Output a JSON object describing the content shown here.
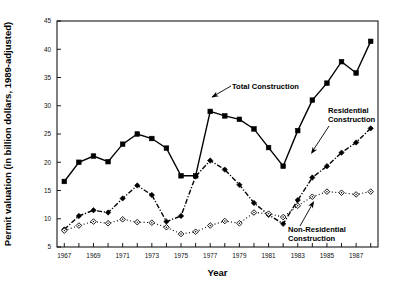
{
  "chart_data": {
    "type": "line",
    "title": "",
    "xlabel": "Year",
    "ylabel": "Permit valuation (in billion dollars, 1989-adjusted)",
    "xlim": [
      1966.5,
      1988.5
    ],
    "ylim": [
      5,
      45
    ],
    "yticks": [
      5,
      10,
      15,
      20,
      25,
      30,
      35,
      40,
      45
    ],
    "xticks": [
      1967,
      1969,
      1971,
      1973,
      1975,
      1977,
      1979,
      1981,
      1983,
      1985,
      1987
    ],
    "xticks_minor": [
      1968,
      1970,
      1972,
      1974,
      1976,
      1978,
      1980,
      1982,
      1984,
      1986,
      1988
    ],
    "grid": false,
    "legend_position": "inline-annotations",
    "x": [
      1967,
      1968,
      1969,
      1970,
      1971,
      1972,
      1973,
      1974,
      1975,
      1976,
      1977,
      1978,
      1979,
      1980,
      1981,
      1982,
      1983,
      1984,
      1985,
      1986,
      1987,
      1988
    ],
    "series": [
      {
        "name": "Total Construction",
        "marker": "filled-square",
        "linestyle": "solid",
        "color": "#000000",
        "values": [
          16.6,
          20.0,
          21.1,
          20.1,
          23.2,
          25.0,
          24.2,
          22.5,
          17.6,
          17.6,
          29.0,
          28.2,
          27.6,
          25.9,
          22.6,
          19.3,
          25.6,
          31.0,
          34.0,
          37.8,
          35.8,
          41.4
        ]
      },
      {
        "name": "Residential Construction",
        "marker": "filled-diamond",
        "linestyle": "dashdot",
        "color": "#000000",
        "values": [
          8.1,
          10.5,
          11.5,
          11.1,
          13.6,
          15.9,
          14.2,
          9.5,
          10.5,
          17.5,
          20.3,
          18.7,
          16.0,
          12.8,
          10.7,
          9.1,
          13.3,
          17.3,
          19.3,
          21.7,
          23.5,
          26.0
        ]
      },
      {
        "name": "Non-Residential Construction",
        "marker": "open-diamond",
        "linestyle": "dotted",
        "color": "#000000",
        "values": [
          7.9,
          8.8,
          9.5,
          9.2,
          9.9,
          9.4,
          9.3,
          8.5,
          7.3,
          7.7,
          8.8,
          9.6,
          9.2,
          11.1,
          10.9,
          10.3,
          12.3,
          13.9,
          14.8,
          14.6,
          14.3,
          14.8
        ]
      }
    ],
    "annotations": [
      {
        "name": "total-construction",
        "text": "Total Construction"
      },
      {
        "name": "residential-construction",
        "text_line1": "Residential",
        "text_line2": "Construction"
      },
      {
        "name": "non-residential-construction",
        "text_line1": "Non-Residential",
        "text_line2": "Construction"
      }
    ]
  }
}
